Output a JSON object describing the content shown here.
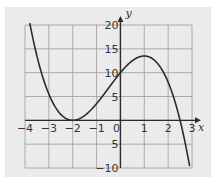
{
  "chart_data": {
    "type": "line",
    "title": "",
    "xlabel": "x",
    "ylabel": "y",
    "xlim": [
      -4,
      3
    ],
    "ylim": [
      -10,
      20
    ],
    "x_ticks": [
      -4,
      -3,
      -2,
      -1,
      0,
      1,
      2,
      3
    ],
    "x_tick_labels": [
      "−4",
      "−3",
      "−2",
      "−1",
      "0",
      "1",
      "2",
      "3"
    ],
    "y_ticks": [
      20,
      15,
      10,
      5,
      -5,
      -10
    ],
    "y_tick_labels": [
      "20",
      "15",
      "10",
      "5",
      "5",
      "−10"
    ],
    "grid": true,
    "grid_x_step": 1,
    "grid_y_step": 5,
    "legend": null,
    "series": [
      {
        "name": "y = -(x+2)^2 (x-2.5)",
        "x": [
          -3.75,
          -3.5,
          -3,
          -2.5,
          -2,
          -1.5,
          -1,
          -0.5,
          0,
          0.5,
          1,
          1.5,
          2,
          2.5,
          2.9
        ],
        "y": [
          19.1,
          13.5,
          5.5,
          1.25,
          0,
          1.0,
          3.5,
          7.5,
          10,
          12.25,
          13.5,
          12.25,
          8,
          0,
          -9.6
        ]
      }
    ],
    "colors": {
      "curve": "#2b2b2b",
      "grid": "#9a9a9a",
      "axis": "#2b2b2b",
      "background": "#ebebeb"
    }
  }
}
